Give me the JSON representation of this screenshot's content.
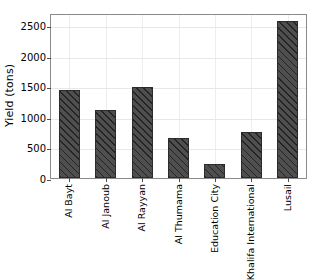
{
  "chart_data": {
    "type": "bar",
    "title": "",
    "xlabel": "",
    "ylabel": "Yield (tons)",
    "categories": [
      "Al Bayt",
      "Al Janoub",
      "Al Rayyan",
      "Al Thumama",
      "Education City",
      "Khalifa International",
      "Lusail"
    ],
    "values": [
      1440,
      1120,
      1490,
      650,
      230,
      750,
      2570
    ],
    "ylim": [
      0,
      2700
    ],
    "yticks": [
      0,
      500,
      1000,
      1500,
      2000,
      2500
    ],
    "ytick_labels": [
      "0",
      "500",
      "1000",
      "1500",
      "2000",
      "2500"
    ],
    "grid": true,
    "legend": false,
    "bar_color": "#4f4f4f",
    "bar_edge_color": "#2b2b2b",
    "bar_hatch": "diagonal-stripes",
    "background_color": "#ffffff",
    "axis_color": "#8a8a8a",
    "grid_color": "#e8e8e8",
    "xtick_rotation": 90
  }
}
